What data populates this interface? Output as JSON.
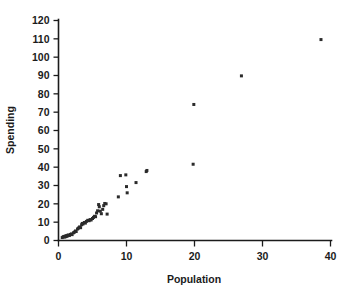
{
  "chart_data": {
    "type": "scatter",
    "title": "",
    "xlabel": "Population",
    "ylabel": "Spending",
    "xlim": [
      0,
      40
    ],
    "ylim": [
      0,
      120
    ],
    "xticks": [
      0,
      10,
      20,
      30,
      40
    ],
    "yticks": [
      0,
      10,
      20,
      30,
      40,
      50,
      60,
      70,
      80,
      90,
      100,
      110,
      120
    ],
    "xtick_labels": [
      "0",
      "10",
      "20",
      "30",
      "40"
    ],
    "ytick_labels": [
      "0",
      "10",
      "20",
      "30",
      "40",
      "50",
      "60",
      "70",
      "80",
      "90",
      "100",
      "110",
      "120"
    ],
    "grid": false,
    "legend": null,
    "marker": {
      "shape": "square",
      "size": 3,
      "color": "#2b2b2b"
    },
    "points": [
      [
        0.55,
        1.6
      ],
      [
        0.7,
        2.0
      ],
      [
        0.8,
        2.2
      ],
      [
        0.9,
        1.9
      ],
      [
        1.0,
        2.4
      ],
      [
        1.05,
        2.1
      ],
      [
        1.15,
        2.6
      ],
      [
        1.25,
        2.3
      ],
      [
        1.35,
        2.8
      ],
      [
        1.45,
        3.0
      ],
      [
        1.6,
        2.7
      ],
      [
        1.75,
        3.3
      ],
      [
        1.9,
        3.6
      ],
      [
        2.0,
        3.2
      ],
      [
        2.2,
        4.2
      ],
      [
        2.35,
        4.6
      ],
      [
        2.5,
        5.2
      ],
      [
        2.6,
        4.9
      ],
      [
        2.8,
        6.3
      ],
      [
        2.95,
        6.8
      ],
      [
        3.1,
        7.4
      ],
      [
        3.25,
        7.0
      ],
      [
        3.4,
        8.6
      ],
      [
        3.5,
        9.3
      ],
      [
        3.6,
        9.0
      ],
      [
        3.8,
        9.8
      ],
      [
        3.95,
        9.5
      ],
      [
        4.1,
        10.4
      ],
      [
        4.3,
        11.0
      ],
      [
        4.5,
        10.8
      ],
      [
        4.65,
        11.4
      ],
      [
        4.8,
        11.2
      ],
      [
        5.0,
        12.0
      ],
      [
        5.15,
        12.6
      ],
      [
        5.3,
        13.2
      ],
      [
        5.45,
        13.0
      ],
      [
        5.6,
        15.0
      ],
      [
        5.75,
        16.2
      ],
      [
        5.9,
        19.6
      ],
      [
        6.0,
        18.4
      ],
      [
        6.15,
        16.0
      ],
      [
        6.3,
        14.6
      ],
      [
        6.5,
        17.0
      ],
      [
        6.65,
        19.0
      ],
      [
        6.8,
        20.2
      ],
      [
        7.0,
        20.0
      ],
      [
        7.15,
        14.4
      ],
      [
        8.8,
        23.8
      ],
      [
        9.1,
        35.4
      ],
      [
        9.9,
        35.8
      ],
      [
        10.0,
        29.4
      ],
      [
        10.1,
        26.0
      ],
      [
        11.4,
        31.6
      ],
      [
        12.9,
        37.6
      ],
      [
        13.0,
        38.2
      ],
      [
        19.8,
        41.6
      ],
      [
        19.9,
        74.2
      ],
      [
        26.9,
        89.8
      ],
      [
        38.6,
        109.6
      ]
    ]
  }
}
